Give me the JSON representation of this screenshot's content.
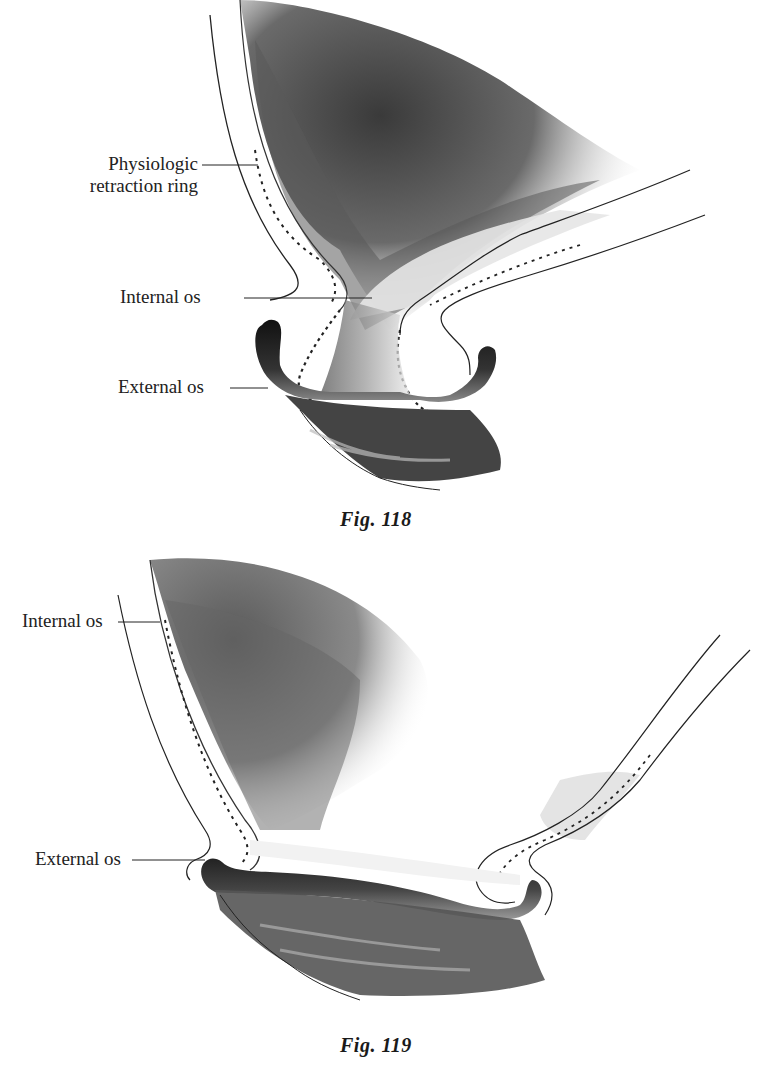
{
  "figures": [
    {
      "id": "fig118",
      "caption": "Fig. 118",
      "labels": {
        "retraction_ring_line1": "Physiologic",
        "retraction_ring_line2": "retraction ring",
        "internal_os": "Internal os",
        "external_os": "External os"
      }
    },
    {
      "id": "fig119",
      "caption": "Fig. 119",
      "labels": {
        "internal_os": "Internal os",
        "external_os": "External os"
      }
    }
  ],
  "colors": {
    "ink": "#1a1a1a",
    "tissue_dark": "#2a2a2a",
    "tissue_mid": "#7a7a7a",
    "tissue_light": "#d8d8d8",
    "background": "#ffffff"
  }
}
